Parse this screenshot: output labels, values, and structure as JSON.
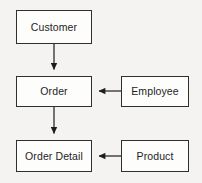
{
  "diagram": {
    "type": "entity-relationship-flow",
    "background_color": "#f4f3f1",
    "node_fill_color": "#fdfdfc",
    "node_border_color": "#2f2f2f",
    "edge_color": "#1d1d1d",
    "text_color": "#1d1d1d",
    "nodes": [
      {
        "id": "customer",
        "label": "Customer"
      },
      {
        "id": "order",
        "label": "Order"
      },
      {
        "id": "employee",
        "label": "Employee"
      },
      {
        "id": "orderdetail",
        "label": "Order Detail"
      },
      {
        "id": "product",
        "label": "Product"
      }
    ],
    "edges": [
      {
        "id": "customer-to-order",
        "from": "Customer",
        "to": "Order",
        "direction": "down",
        "label": ""
      },
      {
        "id": "order-to-orderdetail",
        "from": "Order",
        "to": "Order Detail",
        "direction": "down",
        "label": ""
      },
      {
        "id": "employee-to-order",
        "from": "Employee",
        "to": "Order",
        "direction": "left",
        "label": ""
      },
      {
        "id": "product-to-orderdetail",
        "from": "Product",
        "to": "Order Detail",
        "direction": "left",
        "label": ""
      }
    ]
  }
}
